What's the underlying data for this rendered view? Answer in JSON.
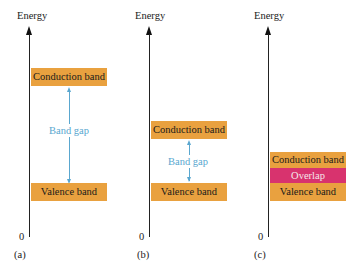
{
  "axis_label": "Energy",
  "zero_label": "0",
  "colors": {
    "band": "#e9a13f",
    "overlap": "#d8336e",
    "gap": "#5aa7cf",
    "axis": "#222222"
  },
  "panels": [
    {
      "label": "(a)",
      "conduction_band": "Conduction band",
      "valence_band": "Valence band",
      "gap_label": "Band gap"
    },
    {
      "label": "(b)",
      "conduction_band": "Conduction band",
      "valence_band": "Valence band",
      "gap_label": "Band gap"
    },
    {
      "label": "(c)",
      "conduction_band": "Conduction band",
      "overlap_label": "Overlap",
      "valence_band": "Valence band"
    }
  ]
}
